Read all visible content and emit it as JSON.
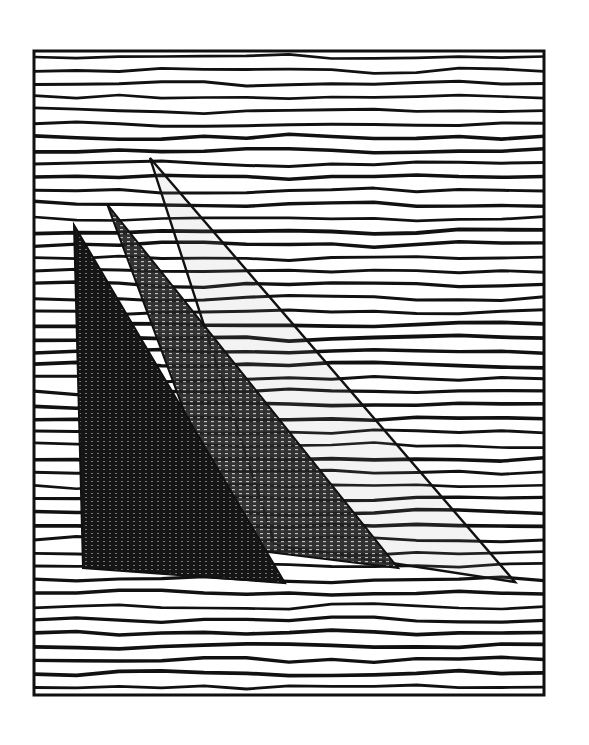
{
  "artwork": {
    "title": "Three sails on a lined sea",
    "colors": {
      "paper": "#ffffff",
      "ink": "#111111",
      "sail_dark": "#151515",
      "sail_mid": "#2a2a2a",
      "sail_light": "#9a9a9a"
    },
    "frame": {
      "x": 34,
      "y": 51,
      "width": 510,
      "height": 644,
      "stroke": 3
    },
    "lines": {
      "count": 48,
      "spacing": 13.4,
      "thickness": 3.2
    },
    "sails": [
      {
        "id": "sail-1",
        "style": "dark-filled",
        "points": [
          [
            74,
            225
          ],
          [
            285,
            583
          ],
          [
            83,
            568
          ]
        ]
      },
      {
        "id": "sail-2",
        "style": "mid-filled",
        "points": [
          [
            107,
            204
          ],
          [
            398,
            568
          ],
          [
            235,
            548
          ]
        ]
      },
      {
        "id": "sail-3",
        "style": "outline",
        "points": [
          [
            150,
            158
          ],
          [
            515,
            582
          ],
          [
            275,
            545
          ]
        ]
      }
    ]
  }
}
